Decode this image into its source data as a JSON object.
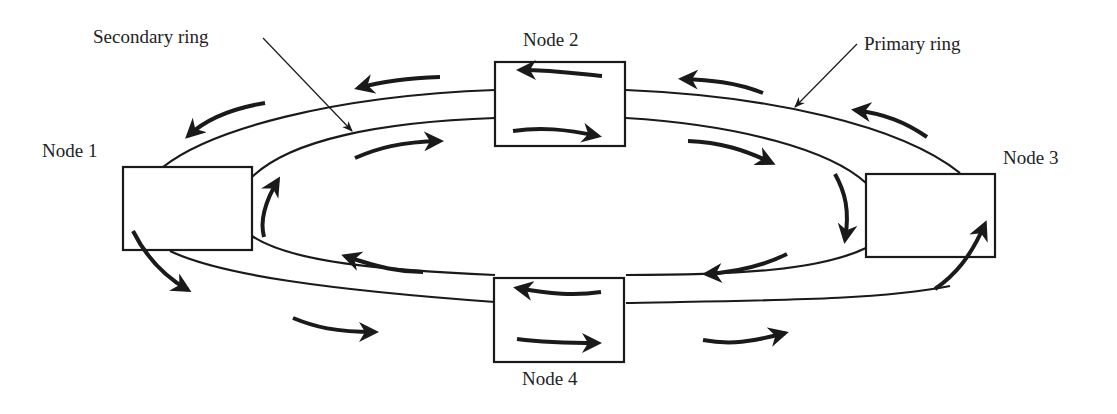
{
  "diagram": {
    "type": "dual-ring network topology",
    "colors": {
      "stroke": "#1a1a1a",
      "background": "#ffffff",
      "text": "#222222"
    },
    "labels": {
      "secondary_ring": "Secondary ring",
      "primary_ring": "Primary ring"
    },
    "nodes": [
      {
        "id": "node1",
        "label": "Node 1"
      },
      {
        "id": "node2",
        "label": "Node 2"
      },
      {
        "id": "node3",
        "label": "Node 3"
      },
      {
        "id": "node4",
        "label": "Node 4"
      }
    ],
    "rings": [
      {
        "name": "Primary ring",
        "position": "outer",
        "flow_direction": "counter-clockwise"
      },
      {
        "name": "Secondary ring",
        "position": "inner",
        "flow_direction": "clockwise"
      }
    ]
  }
}
